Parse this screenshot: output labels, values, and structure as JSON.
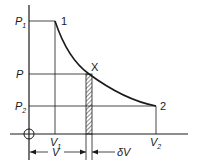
{
  "diagram": {
    "type": "pressure-volume expansion curve",
    "axis_labels": {
      "p1": "P",
      "p1_sub": "1",
      "p": "P",
      "p2": "P",
      "p2_sub": "2",
      "v1": "V",
      "v1_sub": "1",
      "v2": "V",
      "v2_sub": "2"
    },
    "points": {
      "start": "1",
      "mid": "X",
      "end": "2"
    },
    "dimensions": {
      "v": "V",
      "dv": "δV"
    },
    "colors": {
      "line": "#1a1a1a",
      "background": "#ffffff"
    }
  }
}
